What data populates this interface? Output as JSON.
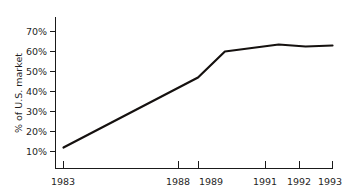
{
  "chart_data": {
    "type": "line",
    "title": "",
    "subtitle": "",
    "xlabel": "",
    "ylabel": "% of U.S. market",
    "x": [
      1983,
      1988,
      1989,
      1991,
      1992,
      1993
    ],
    "categories": [
      "1983",
      "1988",
      "1989",
      "1991",
      "1992",
      "1993"
    ],
    "values": [
      12,
      47,
      60,
      63.5,
      62.5,
      63
    ],
    "series": [
      {
        "name": "% of U.S. market",
        "values": [
          12,
          47,
          60,
          63.5,
          62.5,
          63
        ]
      }
    ],
    "xlim": [
      1983,
      1993
    ],
    "ylim": [
      5,
      72
    ],
    "x_tick_labels": [
      "1983",
      "1988",
      "1989",
      "1991",
      "1992",
      "1993"
    ],
    "x_tick_values": [
      1983,
      1988,
      1989,
      1991,
      1992,
      1993
    ],
    "y_tick_labels": [
      "10%",
      "20%",
      "30%",
      "40%",
      "50%",
      "60%",
      "70%"
    ],
    "y_tick_values": [
      10,
      20,
      30,
      40,
      50,
      60,
      70
    ],
    "grid": false,
    "legend": false,
    "legend_position": "none",
    "line_color": "#15110f",
    "axis_color": "#1a1a1a",
    "background_color": "#ffffff",
    "annotations": []
  }
}
